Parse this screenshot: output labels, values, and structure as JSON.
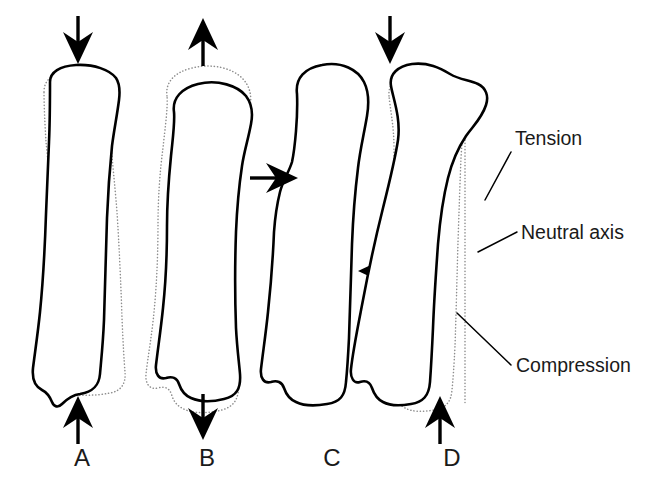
{
  "figure": {
    "background_color": "#ffffff",
    "outline_color": "#000000",
    "ghost_outline_color": "#8d8d8d",
    "text_color": "#1a1a1a"
  },
  "panels": [
    {
      "letter": "A",
      "mode": "Compression",
      "letter_x": 82,
      "letter_y": 466,
      "arrows": [
        {
          "name": "top-arrow-down",
          "direction": "down",
          "x": 78,
          "y_start": 18,
          "y_end": 62
        },
        {
          "name": "bottom-arrow-up",
          "direction": "up",
          "x": 78,
          "y_start": 440,
          "y_end": 396
        }
      ]
    },
    {
      "letter": "B",
      "mode": "Tension",
      "letter_x": 207,
      "letter_y": 466,
      "arrows": [
        {
          "name": "top-arrow-up",
          "direction": "up",
          "x": 203,
          "y_start": 62,
          "y_end": 18
        },
        {
          "name": "bottom-arrow-down",
          "direction": "down",
          "x": 203,
          "y_start": 396,
          "y_end": 440
        }
      ]
    },
    {
      "letter": "C",
      "mode": "Shear",
      "letter_x": 332,
      "letter_y": 466,
      "arrows": [
        {
          "name": "upper-arrow-right",
          "direction": "right",
          "y": 178,
          "x_start": 252,
          "x_end": 296
        },
        {
          "name": "lower-arrow-left",
          "direction": "left",
          "y": 271,
          "x_start": 404,
          "x_end": 360
        }
      ]
    },
    {
      "letter": "D",
      "mode": "Bending",
      "letter_x": 452,
      "letter_y": 466,
      "arrows": [
        {
          "name": "top-arrow-down",
          "direction": "down",
          "x": 390,
          "y_start": 18,
          "y_end": 62
        },
        {
          "name": "bottom-arrow-up",
          "direction": "up",
          "x": 440,
          "y_start": 440,
          "y_end": 396
        }
      ]
    }
  ],
  "callouts": [
    {
      "id": "tension",
      "label": "Tension",
      "text_x": 515,
      "text_y": 145,
      "leader": {
        "x1": 511,
        "y1": 152,
        "x2": 485,
        "y2": 200
      }
    },
    {
      "id": "neutral-axis",
      "label": "Neutral axis",
      "text_x": 521,
      "text_y": 239,
      "leader": {
        "x1": 517,
        "y1": 232,
        "x2": 478,
        "y2": 252
      }
    },
    {
      "id": "compression",
      "label": "Compression",
      "text_x": 516,
      "text_y": 372,
      "leader": {
        "x1": 511,
        "y1": 365,
        "x2": 457,
        "y2": 313
      }
    }
  ]
}
